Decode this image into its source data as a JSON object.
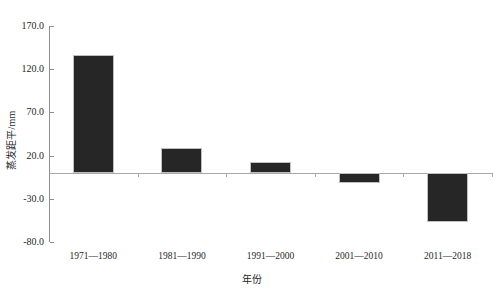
{
  "chart_data": {
    "type": "bar",
    "title": "",
    "subtitle": "",
    "xlabel": "年份",
    "ylabel": "蒸发距平/mm",
    "categories": [
      "1971—1980",
      "1981—1990",
      "1991—2000",
      "2001—2010",
      "2011—2018"
    ],
    "values": [
      137,
      29,
      13,
      -12,
      -57
    ],
    "series": [
      {
        "name": "蒸发距平",
        "values": [
          137,
          29,
          13,
          -12,
          -57
        ]
      }
    ],
    "ylim": [
      -80,
      170
    ],
    "yticks": [
      170.0,
      120.0,
      70.0,
      20.0,
      -30.0,
      -80.0
    ],
    "ytick_labels": [
      "170.0",
      "120.0",
      "70.0",
      "20.0",
      "-30.0",
      "-80.0"
    ],
    "grid": false,
    "legend": false,
    "legend_position": "none",
    "zero_line": true,
    "bar_color": "#262626",
    "bar_edge_color": "#bfbfbf",
    "axis_color": "#8e8e8e",
    "text_color": "#1f1f1f",
    "background_color": "#ffffff"
  }
}
